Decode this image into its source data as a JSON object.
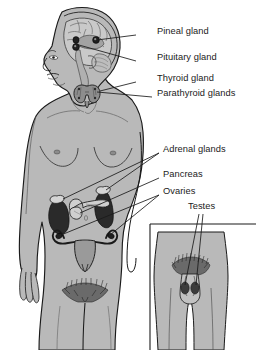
{
  "diagram": {
    "background_color": "#ffffff"
  },
  "colors": {
    "body_fill": "#b9b9b9",
    "body_outline": "#1a1a1a",
    "brain_fill": "#c9c9c9",
    "brain_shadow": "#a2a2a2",
    "gland_dark": "#262626",
    "gland_mid": "#6e6e6e",
    "gland_light": "#cfcfcf",
    "uterus_fill": "#9a9a9a",
    "label_color": "#1b1b1b",
    "leader_line": "#1a1a1a",
    "inset_fill": "#d8d8d8"
  },
  "labels": [
    {
      "id": "pineal-gland",
      "text": "Pineal gland",
      "x": 157,
      "y": 31,
      "leader": {
        "x1": 136,
        "y1": 35,
        "x2": 96,
        "y2": 40
      }
    },
    {
      "id": "pituitary-gland",
      "text": "Pituitary gland",
      "x": 157,
      "y": 57,
      "leader": {
        "x1": 136,
        "y1": 61,
        "x2": 77,
        "y2": 44
      }
    },
    {
      "id": "thyroid-gland",
      "text": "Thyroid gland",
      "x": 157,
      "y": 78,
      "leader": {
        "x1": 136,
        "y1": 82,
        "x2": 92,
        "y2": 90
      }
    },
    {
      "id": "parathyroid-glands",
      "text": "Parathyroid glands",
      "x": 157,
      "y": 93,
      "leader": {
        "x1": 152,
        "y1": 97,
        "x2": 92,
        "y2": 93
      }
    },
    {
      "id": "adrenal-glands",
      "text": "Adrenal glands",
      "x": 163,
      "y": 149,
      "leader": {
        "x1": 159,
        "y1": 153,
        "x2": 68,
        "y2": 196
      }
    },
    {
      "id": "pancreas",
      "text": "Pancreas",
      "x": 163,
      "y": 174,
      "leader": {
        "x1": 159,
        "y1": 178,
        "x2": 88,
        "y2": 203
      }
    },
    {
      "id": "ovaries",
      "text": "Ovaries",
      "x": 163,
      "y": 191,
      "leader": {
        "x1": 159,
        "y1": 195,
        "x2": 62,
        "y2": 232
      }
    },
    {
      "id": "testes",
      "text": "Testes",
      "x": 188,
      "y": 206,
      "leader": {
        "x1": 198,
        "y1": 213,
        "x2": 188,
        "y2": 272
      }
    }
  ],
  "glands": [
    {
      "id": "pineal",
      "name": "Pineal gland",
      "location": "brain-posterior"
    },
    {
      "id": "pituitary",
      "name": "Pituitary gland",
      "location": "brain-base"
    },
    {
      "id": "thyroid",
      "name": "Thyroid gland",
      "location": "neck"
    },
    {
      "id": "parathyroid",
      "name": "Parathyroid glands",
      "location": "neck-posterior-thyroid"
    },
    {
      "id": "adrenal",
      "name": "Adrenal glands",
      "location": "superior-kidneys"
    },
    {
      "id": "pancreas",
      "name": "Pancreas",
      "location": "upper-abdomen"
    },
    {
      "id": "ovaries",
      "name": "Ovaries",
      "location": "pelvis-female"
    },
    {
      "id": "testes",
      "name": "Testes",
      "location": "scrotum-male-inset"
    }
  ],
  "figures": [
    {
      "id": "female-figure",
      "name": "Female anterior body figure"
    },
    {
      "id": "male-inset",
      "name": "Male pelvis inset"
    }
  ]
}
